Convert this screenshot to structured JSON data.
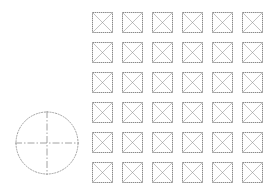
{
  "diagram": {
    "stroke_color": "#8a8a8a",
    "grid": {
      "rows": 6,
      "cols": 6,
      "origin_x": 92,
      "origin_y": 12,
      "pitch_x": 30,
      "pitch_y": 30,
      "box_size": 20,
      "symbol": "box-with-x"
    },
    "circle": {
      "cx": 47,
      "cy": 143,
      "r": 31,
      "crosshair": true,
      "crosshair_style": "dash-dot"
    }
  }
}
